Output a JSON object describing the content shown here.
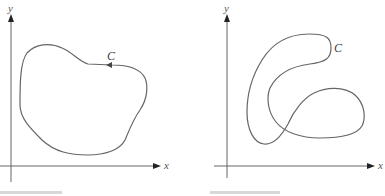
{
  "figures": [
    {
      "id": "left",
      "axes": {
        "x_label": "x",
        "y_label": "y"
      },
      "curve_label": "C",
      "curve_type": "simple closed curve",
      "orientation_arrow": "counterclockwise"
    },
    {
      "id": "right",
      "axes": {
        "x_label": "x",
        "y_label": "y"
      },
      "curve_label": "C",
      "curve_type": "closed curve, self-intersecting"
    }
  ],
  "colors": {
    "curve": "#666666",
    "axis": "#555555",
    "arrowhead": "#222222"
  }
}
